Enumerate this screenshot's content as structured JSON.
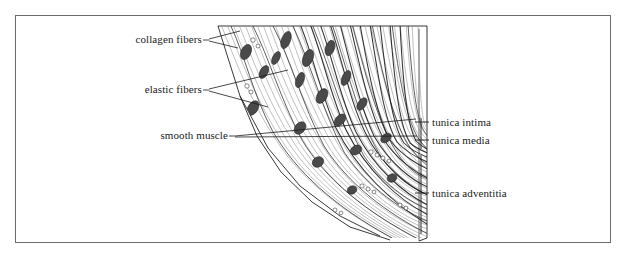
{
  "figure": {
    "frame_color": "#6b6b6b",
    "ink_color": "#1a1a1a",
    "background_color": "#ffffff"
  },
  "labels": {
    "collagen_fibers": "collagen fibers",
    "elastic_fibers": "elastic fibers",
    "smooth_muscle": "smooth muscle",
    "tunica_intima": "tunica intima",
    "tunica_media": "tunica media",
    "tunica_adventitia": "tunica adventitia"
  },
  "structures": [
    {
      "name": "collagen fibers",
      "side": "left",
      "leader_count": 2
    },
    {
      "name": "elastic fibers",
      "side": "left",
      "leader_count": 2
    },
    {
      "name": "smooth muscle",
      "side": "left",
      "leader_count": 2
    },
    {
      "name": "tunica intima",
      "side": "right",
      "leader_count": 1
    },
    {
      "name": "tunica media",
      "side": "right",
      "leader_count": 1
    },
    {
      "name": "tunica adventitia",
      "side": "right",
      "leader_count": 1
    }
  ],
  "block": {
    "top_edge_y": 26,
    "right_edge_x": 424,
    "right_edge_top_y": 26,
    "right_edge_bottom_y": 238,
    "description": "three-dimensional wedge of vessel wall, fibers running obliquely from upper-left to lower-right"
  }
}
